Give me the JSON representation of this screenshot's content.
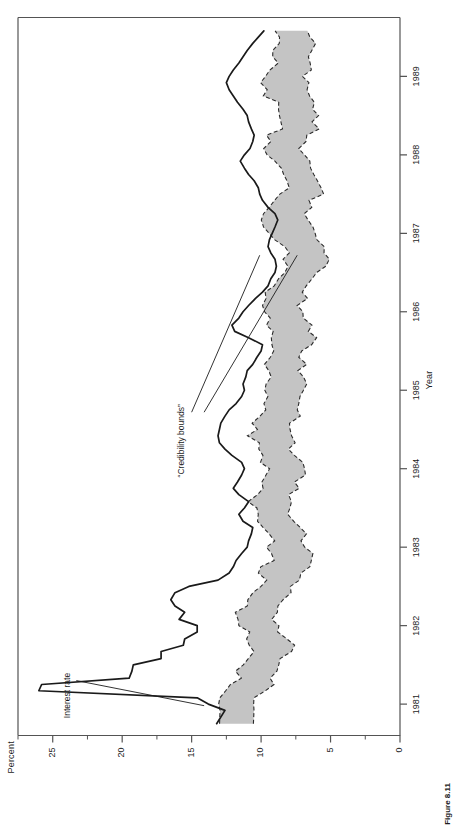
{
  "figure": {
    "caption": "Figure 8.11",
    "yaxis_title": "Percent",
    "xaxis_title": "Year"
  },
  "annotations": {
    "interest_rate": "Interest rate",
    "credibility_bounds": "“Credibility bounds”"
  },
  "chart_data": {
    "type": "line",
    "title": "",
    "subtitle": "",
    "xlabel": "Year",
    "ylabel": "Percent",
    "xlim": [
      1980.6,
      1989.75
    ],
    "ylim": [
      0,
      27.5
    ],
    "grid": false,
    "legend": "none",
    "x_tick_labels": [
      "1981",
      "1982",
      "1983",
      "1984",
      "1985",
      "1986",
      "1987",
      "1988",
      "1989"
    ],
    "x_ticks": [
      1981,
      1982,
      1983,
      1984,
      1985,
      1986,
      1987,
      1988,
      1989
    ],
    "y_ticks": [
      0,
      5,
      10,
      15,
      20,
      25
    ],
    "y_tick_labels": [
      "0",
      "5",
      "10",
      "15",
      "20",
      "25"
    ],
    "y_minor_ticks": [
      2.5,
      7.5,
      12.5,
      17.5,
      22.5,
      27.5
    ],
    "annotations": [
      {
        "text": "Interest rate",
        "series": "interest_rate"
      },
      {
        "text": "“Credibility bounds”",
        "series": "credibility_bounds"
      }
    ],
    "series": [
      {
        "name": "interest_rate",
        "label": "Interest rate",
        "style": "solid-black-line",
        "x": [
          1980.75,
          1980.92,
          1981.0,
          1981.08,
          1981.17,
          1981.25,
          1981.33,
          1981.42,
          1981.5,
          1981.58,
          1981.67,
          1981.75,
          1981.83,
          1981.92,
          1982.0,
          1982.08,
          1982.17,
          1982.25,
          1982.33,
          1982.42,
          1982.5,
          1982.58,
          1982.67,
          1982.75,
          1982.83,
          1982.92,
          1983.0,
          1983.08,
          1983.17,
          1983.25,
          1983.33,
          1983.42,
          1983.5,
          1983.58,
          1983.67,
          1983.75,
          1983.83,
          1983.92,
          1984.0,
          1984.08,
          1984.17,
          1984.25,
          1984.33,
          1984.42,
          1984.5,
          1984.58,
          1984.67,
          1984.75,
          1984.83,
          1984.92,
          1985.0,
          1985.08,
          1985.17,
          1985.25,
          1985.33,
          1985.42,
          1985.5,
          1985.58,
          1985.67,
          1985.75,
          1985.83,
          1985.92,
          1986.0,
          1986.08,
          1986.17,
          1986.25,
          1986.33,
          1986.42,
          1986.5,
          1986.58,
          1986.67,
          1986.75,
          1986.83,
          1986.92,
          1987.0,
          1987.08,
          1987.17,
          1987.25,
          1987.33,
          1987.42,
          1987.5,
          1987.58,
          1987.67,
          1987.75,
          1987.83,
          1987.92,
          1988.0,
          1988.08,
          1988.17,
          1988.25,
          1988.33,
          1988.42,
          1988.5,
          1988.58,
          1988.67,
          1988.75,
          1988.83,
          1988.92,
          1989.0,
          1989.08,
          1989.17,
          1989.25,
          1989.33,
          1989.42,
          1989.5,
          1989.58
        ],
        "y": [
          13.2,
          12.6,
          13.8,
          14.6,
          26.0,
          25.8,
          19.5,
          19.3,
          19.2,
          17.2,
          17.2,
          15.6,
          15.5,
          14.6,
          14.6,
          15.9,
          15.5,
          16.2,
          16.5,
          16.2,
          15.2,
          13.1,
          12.3,
          12.0,
          11.8,
          11.4,
          11.0,
          10.9,
          10.7,
          10.6,
          11.3,
          11.6,
          11.2,
          10.9,
          11.6,
          12.0,
          11.7,
          11.4,
          11.2,
          11.4,
          12.1,
          12.6,
          13.0,
          13.1,
          13.0,
          12.9,
          12.6,
          12.3,
          11.8,
          11.4,
          11.2,
          11.3,
          11.1,
          11.0,
          10.6,
          10.3,
          10.0,
          9.9,
          10.9,
          11.9,
          12.1,
          11.6,
          11.3,
          10.9,
          10.4,
          9.9,
          9.5,
          9.3,
          9.0,
          8.9,
          9.0,
          9.3,
          9.5,
          9.4,
          9.2,
          9.0,
          8.8,
          9.0,
          9.5,
          9.9,
          10.1,
          10.2,
          10.5,
          10.9,
          11.2,
          11.5,
          11.2,
          10.8,
          10.6,
          10.5,
          10.7,
          10.9,
          11.0,
          11.3,
          11.7,
          12.0,
          12.3,
          12.5,
          12.3,
          12.0,
          11.6,
          11.3,
          11.0,
          10.6,
          10.2,
          9.8
        ]
      },
      {
        "name": "credibility_upper",
        "label": "“Credibility bounds” upper",
        "style": "dashed-boundary",
        "x": [
          1980.75,
          1980.92,
          1981.0,
          1981.08,
          1981.17,
          1981.25,
          1981.33,
          1981.42,
          1981.5,
          1981.58,
          1981.67,
          1981.75,
          1981.83,
          1981.92,
          1982.0,
          1982.08,
          1982.17,
          1982.25,
          1982.33,
          1982.42,
          1982.5,
          1982.58,
          1982.67,
          1982.75,
          1982.83,
          1982.92,
          1983.0,
          1983.08,
          1983.17,
          1983.25,
          1983.33,
          1983.42,
          1983.5,
          1983.58,
          1983.67,
          1983.75,
          1983.83,
          1983.92,
          1984.0,
          1984.08,
          1984.17,
          1984.25,
          1984.33,
          1984.42,
          1984.5,
          1984.58,
          1984.67,
          1984.75,
          1984.83,
          1984.92,
          1985.0,
          1985.08,
          1985.17,
          1985.25,
          1985.33,
          1985.42,
          1985.5,
          1985.58,
          1985.67,
          1985.75,
          1985.83,
          1985.92,
          1986.0,
          1986.08,
          1986.17,
          1986.25,
          1986.33,
          1986.42,
          1986.5,
          1986.58,
          1986.67,
          1986.75,
          1986.83,
          1986.92,
          1987.0,
          1987.08,
          1987.17,
          1987.25,
          1987.33,
          1987.42,
          1987.5,
          1987.58,
          1987.67,
          1987.75,
          1987.83,
          1987.92,
          1988.0,
          1988.08,
          1988.17,
          1988.25,
          1988.33,
          1988.42,
          1988.5,
          1988.58,
          1988.67,
          1988.75,
          1988.83,
          1988.92,
          1989.0,
          1989.08,
          1989.17,
          1989.25,
          1989.33,
          1989.42,
          1989.5,
          1989.58
        ],
        "y": [
          13.0,
          12.9,
          13.4,
          13.2,
          12.6,
          12.2,
          11.8,
          11.5,
          11.2,
          11.0,
          10.7,
          10.6,
          10.9,
          11.2,
          11.6,
          11.9,
          11.7,
          11.3,
          10.9,
          10.6,
          10.3,
          10.0,
          9.8,
          9.6,
          9.4,
          9.3,
          9.2,
          9.3,
          9.5,
          9.8,
          10.1,
          10.4,
          10.6,
          10.5,
          10.3,
          10.1,
          9.9,
          9.8,
          9.7,
          9.8,
          10.0,
          10.3,
          10.5,
          10.6,
          10.5,
          10.3,
          10.1,
          9.9,
          9.7,
          9.6,
          9.5,
          9.5,
          9.6,
          9.7,
          9.8,
          9.7,
          9.5,
          9.3,
          9.1,
          9.0,
          9.2,
          9.5,
          9.8,
          9.9,
          9.7,
          9.4,
          9.1,
          8.8,
          8.5,
          8.3,
          8.2,
          8.3,
          8.5,
          8.8,
          9.1,
          9.4,
          9.6,
          9.5,
          9.2,
          8.9,
          8.6,
          8.4,
          8.3,
          8.5,
          8.8,
          9.1,
          9.4,
          9.6,
          9.5,
          9.2,
          8.9,
          8.7,
          8.6,
          8.8,
          9.1,
          9.4,
          9.6,
          9.7,
          9.6,
          9.4,
          9.1,
          8.9,
          8.8,
          8.9,
          9.1,
          9.3
        ]
      },
      {
        "name": "credibility_lower",
        "label": "“Credibility bounds” lower",
        "style": "dashed-boundary",
        "x": [
          1980.75,
          1980.92,
          1981.0,
          1981.08,
          1981.17,
          1981.25,
          1981.33,
          1981.42,
          1981.5,
          1981.58,
          1981.67,
          1981.75,
          1981.83,
          1981.92,
          1982.0,
          1982.08,
          1982.17,
          1982.25,
          1982.33,
          1982.42,
          1982.5,
          1982.58,
          1982.67,
          1982.75,
          1982.83,
          1982.92,
          1983.0,
          1983.08,
          1983.17,
          1983.25,
          1983.33,
          1983.42,
          1983.5,
          1983.58,
          1983.67,
          1983.75,
          1983.83,
          1983.92,
          1984.0,
          1984.08,
          1984.17,
          1984.25,
          1984.33,
          1984.42,
          1984.5,
          1984.58,
          1984.67,
          1984.75,
          1984.83,
          1984.92,
          1985.0,
          1985.08,
          1985.17,
          1985.25,
          1985.33,
          1985.42,
          1985.5,
          1985.58,
          1985.67,
          1985.75,
          1985.83,
          1985.92,
          1986.0,
          1986.08,
          1986.17,
          1986.25,
          1986.33,
          1986.42,
          1986.5,
          1986.58,
          1986.67,
          1986.75,
          1986.83,
          1986.92,
          1987.0,
          1987.08,
          1987.17,
          1987.25,
          1987.33,
          1987.42,
          1987.5,
          1987.58,
          1987.67,
          1987.75,
          1987.83,
          1987.92,
          1988.0,
          1988.08,
          1988.17,
          1988.25,
          1988.33,
          1988.42,
          1988.5,
          1988.58,
          1988.67,
          1988.75,
          1988.83,
          1988.92,
          1989.0,
          1989.08,
          1989.17,
          1989.25,
          1989.33,
          1989.42,
          1989.5,
          1989.58
        ],
        "y": [
          10.6,
          10.4,
          10.8,
          10.6,
          10.0,
          9.5,
          9.1,
          8.8,
          8.4,
          8.2,
          8.0,
          7.9,
          8.2,
          8.6,
          8.9,
          9.2,
          9.0,
          8.6,
          8.2,
          7.9,
          7.6,
          7.3,
          7.1,
          6.9,
          6.8,
          6.7,
          6.6,
          6.7,
          6.9,
          7.2,
          7.5,
          7.8,
          7.9,
          7.8,
          7.6,
          7.4,
          7.2,
          7.1,
          7.0,
          7.1,
          7.3,
          7.6,
          7.8,
          7.9,
          7.8,
          7.6,
          7.4,
          7.2,
          7.0,
          6.9,
          6.8,
          6.8,
          6.9,
          7.0,
          7.1,
          7.0,
          6.8,
          6.6,
          6.4,
          6.3,
          6.5,
          6.8,
          7.1,
          7.2,
          7.0,
          6.7,
          6.4,
          6.1,
          5.8,
          5.6,
          5.5,
          5.6,
          5.8,
          6.1,
          6.4,
          6.7,
          6.9,
          6.8,
          6.5,
          6.2,
          5.9,
          5.7,
          5.6,
          5.8,
          6.1,
          6.4,
          6.7,
          6.9,
          6.8,
          6.5,
          6.2,
          6.0,
          5.9,
          6.1,
          6.4,
          6.7,
          6.9,
          7.0,
          6.9,
          6.7,
          6.4,
          6.2,
          6.1,
          6.2,
          6.4,
          6.6
        ]
      }
    ],
    "band_fill_color": "#c4c4c4",
    "line_color": "#1a1a1a",
    "axis_color": "#545454"
  }
}
